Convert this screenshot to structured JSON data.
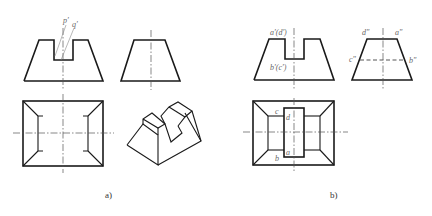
{
  "figure": {
    "panels": [
      {
        "caption": "a)",
        "views": [
          "front-view",
          "side-view",
          "top-view",
          "isometric-view"
        ],
        "labels": {
          "p": "p'",
          "q": "q'"
        }
      },
      {
        "caption": "b)",
        "views": [
          "front-view",
          "side-view",
          "top-view"
        ],
        "labels": {
          "front_top": "a'(d')",
          "front_bottom": "b'(c')",
          "side_d": "d\"",
          "side_a": "a\"",
          "side_c": "c\"",
          "side_b": "b\"",
          "top_c": "c",
          "top_d": "d",
          "top_a": "a",
          "top_b": "b"
        }
      }
    ],
    "colors": {
      "line": "#1a1a1a",
      "label": "#666666",
      "background": "#ffffff"
    }
  }
}
